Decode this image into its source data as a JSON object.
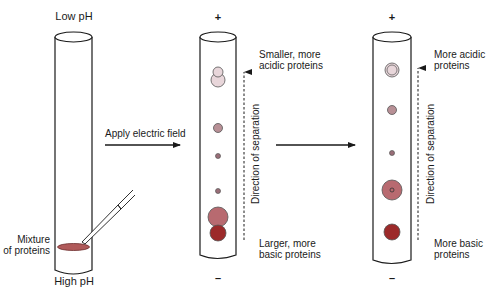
{
  "diagram": {
    "tubes": [
      {
        "id": "initial",
        "top_label": "Low pH",
        "bottom_label": "High pH",
        "sample_label": "Mixture\nof proteins"
      },
      {
        "id": "after-field",
        "top_sign": "+",
        "bottom_sign": "–",
        "top_annotation": "Smaller, more\nacidic proteins",
        "bottom_annotation": "Larger, more\nbasic proteins",
        "direction_label": "Direction of separation"
      },
      {
        "id": "final",
        "top_sign": "+",
        "bottom_sign": "–",
        "top_annotation": "More acidic\nproteins",
        "bottom_annotation": "More basic\nproteins",
        "direction_label": "Direction of separation"
      }
    ],
    "arrows": [
      {
        "id": "apply-field",
        "label": "Apply electric field"
      },
      {
        "id": "continue",
        "label": ""
      }
    ],
    "colors": {
      "outline": "#1a1a1a",
      "sample_band": "#b05a5a",
      "protein_light": "#e8d6da",
      "protein_mauve": "#b89096",
      "protein_small": "#9a6e78",
      "protein_mid": "#b86a70",
      "protein_dark": "#9c2a2a"
    }
  }
}
